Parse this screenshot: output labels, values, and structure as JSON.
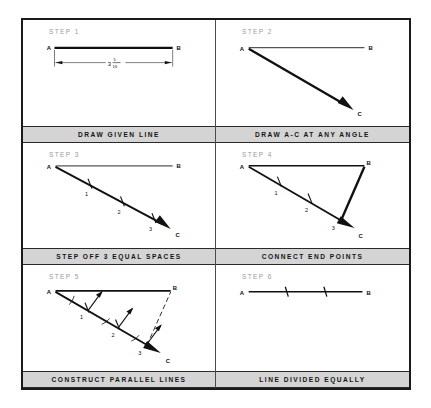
{
  "figure": {
    "panel_count": 6,
    "columns": 2,
    "rows": 3,
    "frame_color": "#1a1a1a",
    "caption_bg": "#d4d4d4",
    "line_color": "#111111",
    "step_label_color": "#9a9a9a"
  },
  "panels": [
    {
      "step_label": "STEP 1",
      "caption": "DRAW GIVEN LINE",
      "point_a": "A",
      "point_b": "B",
      "dimension_whole": "3",
      "dimension_numerator": "5",
      "dimension_denominator": "16",
      "dimension_full": "3 5/16"
    },
    {
      "step_label": "STEP 2",
      "caption": "DRAW A-C AT ANY ANGLE",
      "point_a": "A",
      "point_b": "B",
      "point_c": "C"
    },
    {
      "step_label": "STEP 3",
      "caption": "STEP OFF 3 EQUAL SPACES",
      "point_a": "A",
      "point_b": "B",
      "point_c": "C",
      "tick_labels": [
        "1",
        "2",
        "3"
      ]
    },
    {
      "step_label": "STEP 4",
      "caption": "CONNECT END POINTS",
      "point_a": "A",
      "point_b": "B",
      "point_c": "C",
      "tick_labels": [
        "1",
        "2",
        "3"
      ]
    },
    {
      "step_label": "STEP 5",
      "caption": "CONSTRUCT PARALLEL LINES",
      "point_a": "A",
      "point_b": "B",
      "point_c": "C",
      "tick_labels": [
        "1",
        "2",
        "3"
      ]
    },
    {
      "step_label": "STEP 6",
      "caption": "LINE DIVIDED EQUALLY",
      "point_a": "A",
      "point_b": "B",
      "division_count": 3
    }
  ]
}
